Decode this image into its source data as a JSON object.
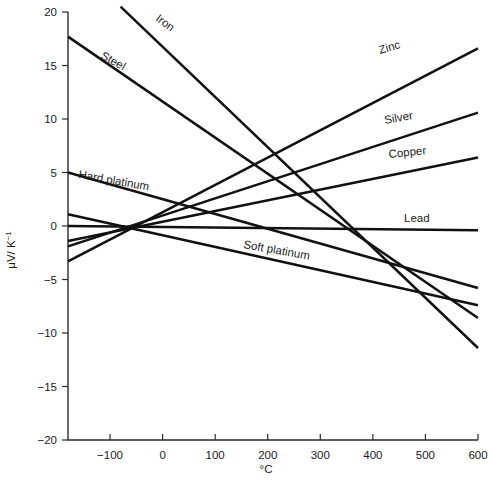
{
  "chart_data": {
    "type": "line",
    "title": "",
    "subtitle": "",
    "xlabel": "°C",
    "ylabel": "μV/ K−1",
    "ylabel_base": "μV/ K",
    "ylabel_exponent": "−1",
    "xlim": [
      -180,
      600
    ],
    "ylim": [
      -20,
      20
    ],
    "grid": false,
    "legend_position": "inline-labels",
    "xticks": [
      -100,
      0,
      100,
      200,
      300,
      400,
      500,
      600
    ],
    "xticklabels": [
      "−100",
      "0",
      "100",
      "200",
      "300",
      "400",
      "500",
      "600"
    ],
    "yticks": [
      20,
      15,
      10,
      5,
      0,
      -5,
      -10,
      -15,
      -20
    ],
    "yticklabels": [
      "20",
      "15",
      "10",
      "5",
      "0",
      "−5",
      "−10",
      "−15",
      "−20"
    ],
    "series": [
      {
        "name": "Iron",
        "label": "Iron",
        "x": [
          -80,
          600
        ],
        "y": [
          20.5,
          -11.4
        ],
        "label_x": 155,
        "label_y": 20,
        "label_rotation": 36
      },
      {
        "name": "Steel",
        "label": "Steel",
        "x": [
          -180,
          600
        ],
        "y": [
          17.7,
          -8.6
        ],
        "label_x": 100,
        "label_y": 58,
        "label_rotation": 29
      },
      {
        "name": "Hard platinum",
        "label": "Hard platinum",
        "x": [
          -180,
          600
        ],
        "y": [
          5.0,
          -5.8
        ],
        "label_x": 78,
        "label_y": 178,
        "label_rotation": 10
      },
      {
        "name": "Soft platinum",
        "label": "Soft platinum",
        "x": [
          -180,
          600
        ],
        "y": [
          1.1,
          -7.4
        ],
        "label_x": 243,
        "label_y": 248,
        "label_rotation": 10
      },
      {
        "name": "Lead",
        "label": "Lead",
        "x": [
          -180,
          600
        ],
        "y": [
          0.0,
          -0.4
        ],
        "label_x": 404,
        "label_y": 222,
        "label_rotation": 0
      },
      {
        "name": "Copper",
        "label": "Copper",
        "x": [
          -180,
          600
        ],
        "y": [
          -1.4,
          6.4
        ],
        "label_x": 389,
        "label_y": 158,
        "label_rotation": -6
      },
      {
        "name": "Silver",
        "label": "Silver",
        "x": [
          -180,
          600
        ],
        "y": [
          -1.9,
          10.6
        ],
        "label_x": 385,
        "label_y": 124,
        "label_rotation": -10
      },
      {
        "name": "Zinc",
        "label": "Zinc",
        "x": [
          -180,
          600
        ],
        "y": [
          -3.3,
          16.6
        ],
        "label_x": 380,
        "label_y": 54,
        "label_rotation": -16
      }
    ]
  },
  "axes": {
    "x_axis_name": "temperature-axis",
    "y_axis_name": "seebeck-axis"
  }
}
